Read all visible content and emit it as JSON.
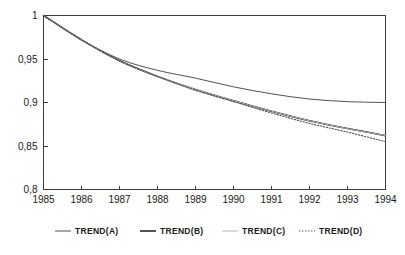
{
  "chart_data": {
    "type": "line",
    "title": "",
    "subtitle": "",
    "xlabel": "",
    "ylabel": "",
    "xlim": [
      1985,
      1994
    ],
    "ylim": [
      0.8,
      1.0
    ],
    "grid": false,
    "legend_position": "bottom",
    "x": [
      1985,
      1986,
      1987,
      1988,
      1989,
      1990,
      1991,
      1992,
      1993,
      1994
    ],
    "xtick_labels": [
      "1985",
      "1986",
      "1987",
      "1988",
      "1989",
      "1990",
      "1991",
      "1992",
      "1993",
      "1994"
    ],
    "ytick_values": [
      0.8,
      0.85,
      0.9,
      0.95,
      1.0
    ],
    "ytick_labels": [
      "0,8",
      "0,85",
      "0,9",
      "0,95",
      "1"
    ],
    "series": [
      {
        "name": "TREND(A)",
        "style": "solid-thin",
        "color": "#3c3c3c",
        "width": 0.9,
        "values": [
          1.0,
          0.972,
          0.95,
          0.937,
          0.928,
          0.918,
          0.91,
          0.904,
          0.901,
          0.9
        ]
      },
      {
        "name": "TREND(B)",
        "style": "solid-thick",
        "color": "#1a1a1a",
        "width": 1.5,
        "values": [
          1.0,
          0.972,
          0.948,
          0.93,
          0.915,
          0.902,
          0.89,
          0.879,
          0.87,
          0.862
        ]
      },
      {
        "name": "TREND(C)",
        "style": "solid-faint",
        "color": "#b6b6b6",
        "width": 1.0,
        "values": [
          1.0,
          0.972,
          0.948,
          0.93,
          0.915,
          0.902,
          0.89,
          0.879,
          0.87,
          0.862
        ]
      },
      {
        "name": "TREND(D)",
        "style": "dotted",
        "color": "#555555",
        "width": 1.1,
        "values": [
          1.0,
          0.972,
          0.948,
          0.93,
          0.914,
          0.901,
          0.888,
          0.876,
          0.866,
          0.855
        ]
      }
    ]
  },
  "legend": {
    "items": [
      {
        "label": "TREND(A)"
      },
      {
        "label": "TREND(B)"
      },
      {
        "label": "TREND(C)"
      },
      {
        "label": "TREND(D)"
      }
    ]
  }
}
